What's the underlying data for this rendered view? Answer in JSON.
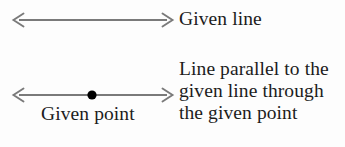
{
  "figure": {
    "background_color": "#fdfdfd",
    "stroke_color": "#7a7a7a",
    "point_color": "#000000",
    "text_color": "#1c1c1c"
  },
  "given_line": {
    "label": "Given line",
    "arrow": {
      "name": "double-headed-arrow",
      "x_start": 13,
      "x_end": 173,
      "y": 20
    }
  },
  "parallel_line": {
    "arrow": {
      "name": "double-headed-arrow",
      "x_start": 13,
      "x_end": 173,
      "y": 95
    },
    "point": {
      "label": "Given point",
      "cx": 92,
      "cy": 95,
      "radius": 4.6
    },
    "description_lines": [
      "Line parallel to the",
      "given line through",
      "the given point"
    ]
  }
}
